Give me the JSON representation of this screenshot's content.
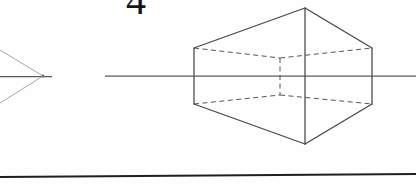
{
  "canvas": {
    "width": 416,
    "height": 189,
    "background": "#fefefe",
    "ink": "#4a4a4f",
    "ink_dark": "#2e2e32",
    "ink_light": "#9a9a9f"
  },
  "figure": {
    "page_number": "4",
    "horizon": {
      "label": "horizon-line",
      "y": 76,
      "x_start": 105,
      "x_end": 416,
      "color": "#5a5a60"
    },
    "ground": {
      "label": "ground-line",
      "x_start": 0,
      "x_end": 416,
      "y_start": 177,
      "y_end": 174,
      "color": "#1f1f23"
    },
    "vanishing_point": {
      "label": "left-vanishing-point",
      "x": 43,
      "y": 76,
      "stub_x_start": 0,
      "stub_x_end": 52
    },
    "convergence_rays": [
      {
        "name": "upper-ray-to-vp",
        "x1": 0,
        "y1": 50,
        "x2": 43,
        "y2": 76
      },
      {
        "name": "lower-ray-to-vp",
        "x1": 0,
        "y1": 103,
        "x2": 43,
        "y2": 76
      }
    ],
    "cube": {
      "label": "perspective-cube",
      "near_vertical_edge": {
        "x": 305,
        "y_top": 8,
        "y_bottom": 144
      },
      "left_vertical_edge": {
        "x": 194,
        "y_top": 48,
        "y_bottom": 104
      },
      "right_vertical_edge": {
        "x": 372,
        "y_top": 48,
        "y_bottom": 104
      },
      "hidden_vertical_edge": {
        "x": 280,
        "y_top": 58,
        "y_bottom": 95
      },
      "solid_edges": [
        {
          "name": "top-left-edge",
          "x1": 194,
          "y1": 48,
          "x2": 305,
          "y2": 8
        },
        {
          "name": "top-right-edge",
          "x1": 305,
          "y1": 8,
          "x2": 372,
          "y2": 48
        },
        {
          "name": "bottom-left-edge",
          "x1": 194,
          "y1": 104,
          "x2": 305,
          "y2": 144
        },
        {
          "name": "bottom-right-edge",
          "x1": 305,
          "y1": 144,
          "x2": 372,
          "y2": 104
        }
      ],
      "dashed_edges": [
        {
          "name": "back-top-left-edge",
          "x1": 194,
          "y1": 48,
          "x2": 280,
          "y2": 58
        },
        {
          "name": "back-top-right-edge",
          "x1": 280,
          "y1": 58,
          "x2": 372,
          "y2": 48
        },
        {
          "name": "back-bottom-left-edge",
          "x1": 194,
          "y1": 104,
          "x2": 280,
          "y2": 95
        },
        {
          "name": "back-bottom-right-edge",
          "x1": 280,
          "y1": 95,
          "x2": 372,
          "y2": 104
        }
      ]
    }
  }
}
